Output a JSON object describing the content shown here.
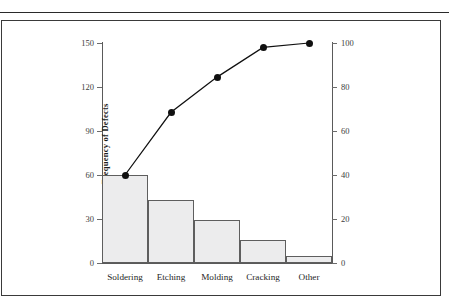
{
  "document": {
    "frame_visible": true,
    "top_rule_visible": true
  },
  "chart_data": {
    "type": "bar",
    "title": "",
    "subtitle": "",
    "categories": [
      "Soldering",
      "Etching",
      "Molding",
      "Cracking",
      "Other"
    ],
    "values": [
      60,
      43,
      29,
      16,
      5
    ],
    "xlabel": "",
    "ylabel": "Frequency of Defects",
    "ylim": [
      0,
      150
    ],
    "yticks": [
      0,
      30,
      60,
      90,
      120,
      150
    ],
    "ytick_labels": [
      "0",
      "30",
      "60",
      "90",
      "120",
      "150"
    ],
    "y2label": "Cumulative Frequency (%)",
    "y2lim": [
      0,
      100
    ],
    "y2ticks": [
      0,
      20,
      40,
      60,
      80,
      100
    ],
    "y2tick_labels": [
      "0",
      "20",
      "40",
      "60",
      "80",
      "100"
    ],
    "grid": false,
    "legend": "none",
    "series": [
      {
        "name": "Frequency of Defects",
        "type": "bar",
        "axis": "left",
        "values": [
          60,
          43,
          29,
          16,
          5
        ],
        "bar_fill": "#ececed",
        "bar_edge": "#5e5e5e"
      },
      {
        "name": "Cumulative Frequency (%)",
        "type": "line",
        "axis": "right",
        "values": [
          40,
          68.5,
          84.5,
          98,
          100
        ],
        "cumulative_counts": [
          60,
          103,
          127,
          147,
          151
        ],
        "line_color": "#101010",
        "marker": "circle",
        "marker_color": "#101010"
      }
    ]
  },
  "axes": {
    "left_ticks": [
      "150",
      "120",
      "90",
      "60",
      "30",
      "0"
    ],
    "right_ticks": [
      "100",
      "80",
      "60",
      "40",
      "20",
      "0"
    ],
    "left_title": "Frequency of Defects",
    "right_title": "Cumulative Frequency (%)"
  },
  "categories": {
    "c0": "Soldering",
    "c1": "Etching",
    "c2": "Molding",
    "c3": "Cracking",
    "c4": "Other"
  }
}
